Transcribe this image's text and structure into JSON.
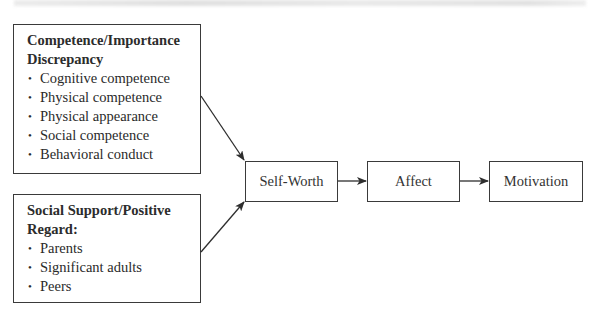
{
  "diagram": {
    "top_band": "",
    "inputs": [
      {
        "id": "competence",
        "heading_lines": [
          "Competence/Importance",
          "Discrepancy"
        ],
        "items": [
          "Cognitive competence",
          "Physical competence",
          "Physical appearance",
          "Social competence",
          "Behavioral conduct"
        ]
      },
      {
        "id": "support",
        "heading_lines": [
          "Social Support/Positive",
          "Regard:"
        ],
        "items": [
          "Parents",
          "Significant adults",
          "Peers"
        ]
      }
    ],
    "chain": [
      {
        "label": "Self-Worth"
      },
      {
        "label": "Affect"
      },
      {
        "label": "Motivation"
      }
    ],
    "bullet": "•",
    "colors": {
      "line": "#2e2e2e",
      "box_border": "#3a3a3a",
      "text": "#2a2a2a"
    }
  }
}
